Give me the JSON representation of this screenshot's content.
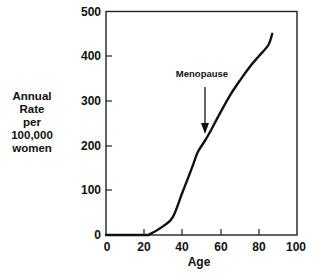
{
  "chart_data": {
    "type": "line",
    "title": "",
    "xlabel": "Age",
    "ylabel": "Annual Rate per 100,000 women",
    "ylabel_lines": [
      "Annual",
      "Rate",
      "per",
      "100,000",
      "women"
    ],
    "xlim": [
      0,
      100
    ],
    "ylim": [
      0,
      500
    ],
    "xticks": [
      0,
      20,
      40,
      60,
      80,
      100
    ],
    "yticks": [
      0,
      100,
      200,
      300,
      400,
      500
    ],
    "grid": false,
    "legend": null,
    "series": [
      {
        "name": "Annual rate",
        "x": [
          0,
          20,
          23,
          30,
          35,
          40,
          45,
          48,
          52,
          55,
          60,
          65,
          70,
          75,
          80,
          85,
          87
        ],
        "y": [
          0,
          0,
          2,
          20,
          40,
          95,
          150,
          185,
          212,
          235,
          275,
          313,
          345,
          375,
          400,
          425,
          450
        ]
      }
    ],
    "annotations": [
      {
        "text": "Menopause",
        "x": 52,
        "y_text": 260,
        "arrow_from": 235,
        "arrow_to": 200
      }
    ]
  },
  "ylabel_lines": [
    "Annual",
    "Rate",
    "per",
    "100,000",
    "women"
  ],
  "xaxis": {
    "title": "Age",
    "ticks": [
      "0",
      "20",
      "40",
      "60",
      "80",
      "100"
    ]
  },
  "yaxis": {
    "ticks": [
      "0",
      "100",
      "200",
      "300",
      "400",
      "500"
    ]
  },
  "annotation": {
    "text": "Menopause"
  }
}
